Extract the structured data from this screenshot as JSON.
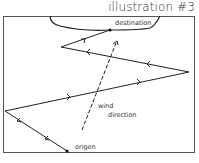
{
  "title": "illustration #3",
  "labels": {
    "destination": "destination",
    "wind_line1": "wind",
    "wind_line2": "direction",
    "origin": "origen"
  },
  "colors": {
    "stroke": "#222222",
    "frame": "#555555",
    "background": "#ffffff"
  },
  "path": {
    "description": "Zig-zag tacking path from origin to destination against the wind",
    "points": [
      [
        67,
        151
      ],
      [
        5,
        111
      ],
      [
        189,
        72
      ],
      [
        61,
        47
      ],
      [
        110,
        30
      ]
    ]
  },
  "wind_arrow": {
    "from": [
      82,
      130
    ],
    "to": [
      117,
      41
    ],
    "style": "dashed"
  }
}
